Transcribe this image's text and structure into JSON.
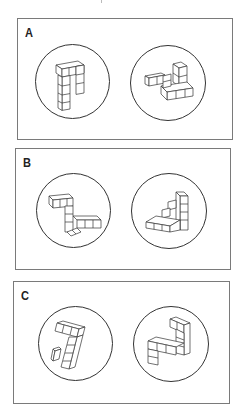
{
  "figure": {
    "panels": [
      {
        "label": "A",
        "left": {
          "shape": "block-figure-A1"
        },
        "right": {
          "shape": "block-figure-A2"
        }
      },
      {
        "label": "B",
        "left": {
          "shape": "block-figure-B1"
        },
        "right": {
          "shape": "block-figure-B2"
        }
      },
      {
        "label": "C",
        "left": {
          "shape": "block-figure-C1"
        },
        "right": {
          "shape": "block-figure-C2"
        }
      }
    ]
  }
}
